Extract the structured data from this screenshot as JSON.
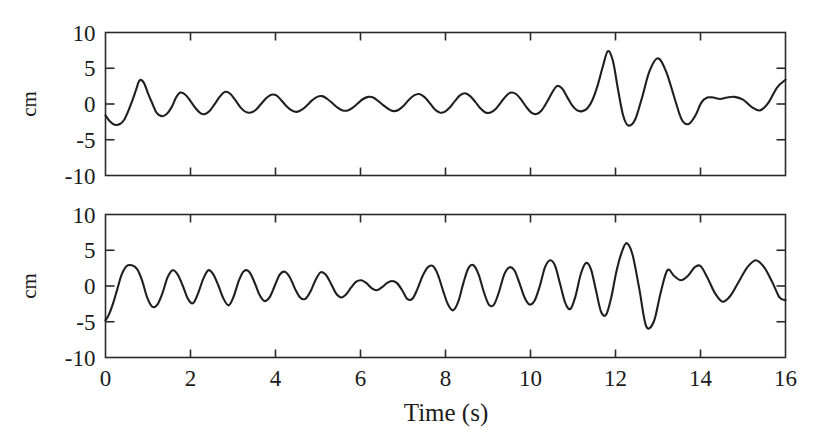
{
  "figure": {
    "type": "time-series-two-panel",
    "background_color": "#ffffff",
    "line_color": "#1f1f1f",
    "axis_color": "#2a2a2a",
    "xlabel": "Time (s)",
    "ylabel_top": "cm",
    "ylabel_bottom": "cm"
  },
  "chart_data": [
    {
      "type": "line",
      "title": "",
      "panel": "top",
      "xlabel": "",
      "ylabel": "cm",
      "xlim": [
        0,
        16
      ],
      "ylim": [
        -10,
        10
      ],
      "xticks": [
        0,
        2,
        4,
        6,
        8,
        10,
        12,
        14,
        16
      ],
      "xticklabels": [
        "",
        "",
        "",
        "",
        "",
        "",
        "",
        "",
        ""
      ],
      "yticks": [
        -10,
        -5,
        0,
        5,
        10
      ],
      "yticklabels": [
        "-10",
        "-5",
        "0",
        "5",
        "10"
      ],
      "grid": false,
      "legend": "none",
      "series": [
        {
          "name": "surface elevation (top record)",
          "x": [
            0.0,
            0.1,
            0.22,
            0.34,
            0.44,
            0.52,
            0.62,
            0.72,
            0.8,
            0.9,
            1.0,
            1.1,
            1.2,
            1.32,
            1.44,
            1.56,
            1.66,
            1.76,
            1.88,
            2.0,
            2.12,
            2.24,
            2.34,
            2.46,
            2.58,
            2.7,
            2.82,
            2.94,
            3.06,
            3.18,
            3.3,
            3.42,
            3.54,
            3.66,
            3.78,
            3.9,
            4.02,
            4.14,
            4.26,
            4.38,
            4.5,
            4.62,
            4.74,
            4.86,
            4.98,
            5.1,
            5.22,
            5.34,
            5.46,
            5.58,
            5.7,
            5.82,
            5.94,
            6.06,
            6.18,
            6.3,
            6.42,
            6.54,
            6.66,
            6.78,
            6.9,
            7.02,
            7.14,
            7.26,
            7.38,
            7.5,
            7.62,
            7.74,
            7.86,
            7.98,
            8.1,
            8.22,
            8.34,
            8.46,
            8.58,
            8.7,
            8.82,
            8.94,
            9.06,
            9.18,
            9.3,
            9.42,
            9.54,
            9.66,
            9.78,
            9.9,
            10.02,
            10.14,
            10.26,
            10.38,
            10.5,
            10.62,
            10.74,
            10.86,
            10.98,
            11.1,
            11.22,
            11.34,
            11.46,
            11.58,
            11.7,
            11.82,
            11.94,
            12.06,
            12.18,
            12.3,
            12.46,
            12.62,
            12.8,
            13.0,
            13.2,
            13.4,
            13.56,
            13.72,
            13.88,
            14.02,
            14.16,
            14.3,
            14.46,
            14.62,
            14.8,
            15.0,
            15.2,
            15.4,
            15.6,
            15.8,
            16.0
          ],
          "y": [
            -1.6,
            -2.4,
            -2.9,
            -2.8,
            -2.2,
            -1.2,
            0.3,
            2.0,
            3.3,
            3.0,
            1.5,
            0.1,
            -1.2,
            -1.7,
            -1.4,
            -0.4,
            0.9,
            1.6,
            1.3,
            0.4,
            -0.6,
            -1.3,
            -1.4,
            -0.9,
            0.1,
            1.1,
            1.7,
            1.4,
            0.5,
            -0.5,
            -1.1,
            -1.2,
            -0.8,
            0.0,
            0.8,
            1.3,
            1.2,
            0.5,
            -0.3,
            -0.9,
            -1.1,
            -0.8,
            -0.2,
            0.5,
            1.0,
            1.1,
            0.7,
            0.1,
            -0.5,
            -0.9,
            -0.9,
            -0.5,
            0.1,
            0.7,
            1.0,
            0.9,
            0.4,
            -0.2,
            -0.7,
            -1.0,
            -0.8,
            -0.2,
            0.6,
            1.2,
            1.4,
            1.0,
            0.2,
            -0.7,
            -1.2,
            -1.1,
            -0.5,
            0.4,
            1.2,
            1.5,
            1.1,
            0.3,
            -0.6,
            -1.2,
            -1.2,
            -0.7,
            0.2,
            1.1,
            1.6,
            1.4,
            0.6,
            -0.4,
            -1.2,
            -1.4,
            -0.9,
            0.2,
            1.5,
            2.5,
            2.2,
            1.0,
            -0.2,
            -0.9,
            -1.0,
            -0.6,
            0.6,
            2.6,
            5.2,
            7.4,
            6.0,
            2.0,
            -1.6,
            -3.0,
            -2.2,
            0.8,
            4.6,
            6.4,
            4.4,
            0.6,
            -2.2,
            -2.8,
            -1.6,
            0.2,
            0.9,
            0.9,
            0.7,
            0.9,
            1.0,
            0.6,
            -0.4,
            -0.9,
            0.2,
            2.3,
            3.4,
            2.2,
            0.0,
            -1.0,
            -0.2,
            1.2,
            2.0,
            1.6,
            0.4
          ]
        }
      ]
    },
    {
      "type": "line",
      "title": "",
      "panel": "bottom",
      "xlabel": "Time (s)",
      "ylabel": "cm",
      "xlim": [
        0,
        16
      ],
      "ylim": [
        -10,
        10
      ],
      "xticks": [
        0,
        2,
        4,
        6,
        8,
        10,
        12,
        14,
        16
      ],
      "xticklabels": [
        "0",
        "2",
        "4",
        "6",
        "8",
        "10",
        "12",
        "14",
        "16"
      ],
      "yticks": [
        -10,
        -5,
        0,
        5,
        10
      ],
      "yticklabels": [
        "-10",
        "-5",
        "0",
        "5",
        "10"
      ],
      "grid": false,
      "legend": "none",
      "series": [
        {
          "name": "surface elevation (bottom record)",
          "x": [
            0.0,
            0.08,
            0.18,
            0.28,
            0.38,
            0.5,
            0.62,
            0.74,
            0.86,
            0.98,
            1.1,
            1.22,
            1.34,
            1.46,
            1.58,
            1.7,
            1.82,
            1.94,
            2.06,
            2.18,
            2.3,
            2.42,
            2.54,
            2.66,
            2.78,
            2.9,
            3.02,
            3.14,
            3.26,
            3.38,
            3.5,
            3.62,
            3.74,
            3.86,
            3.98,
            4.1,
            4.22,
            4.34,
            4.46,
            4.58,
            4.7,
            4.82,
            4.94,
            5.06,
            5.18,
            5.3,
            5.42,
            5.54,
            5.66,
            5.78,
            5.9,
            6.02,
            6.14,
            6.26,
            6.38,
            6.5,
            6.62,
            6.74,
            6.86,
            6.98,
            7.1,
            7.22,
            7.34,
            7.46,
            7.58,
            7.7,
            7.82,
            7.94,
            8.06,
            8.18,
            8.3,
            8.42,
            8.54,
            8.66,
            8.78,
            8.9,
            9.02,
            9.14,
            9.26,
            9.38,
            9.5,
            9.62,
            9.74,
            9.86,
            9.98,
            10.1,
            10.22,
            10.34,
            10.46,
            10.58,
            10.7,
            10.82,
            10.94,
            11.06,
            11.18,
            11.3,
            11.42,
            11.54,
            11.66,
            11.78,
            11.9,
            12.02,
            12.14,
            12.26,
            12.4,
            12.56,
            12.72,
            12.9,
            13.06,
            13.22,
            13.38,
            13.54,
            13.7,
            13.86,
            14.0,
            14.16,
            14.34,
            14.52,
            14.7,
            14.9,
            15.1,
            15.3,
            15.5,
            15.7,
            15.86,
            16.0
          ],
          "y": [
            -4.8,
            -4.0,
            -2.4,
            -0.4,
            1.6,
            2.8,
            2.9,
            2.4,
            0.8,
            -1.6,
            -2.9,
            -2.6,
            -1.0,
            1.2,
            2.2,
            1.6,
            0.0,
            -1.8,
            -2.4,
            -1.0,
            1.0,
            2.2,
            1.6,
            0.0,
            -1.8,
            -2.7,
            -1.4,
            0.8,
            2.1,
            2.0,
            0.6,
            -1.2,
            -2.1,
            -1.6,
            0.0,
            1.6,
            2.0,
            1.2,
            -0.4,
            -1.6,
            -1.8,
            -0.8,
            0.8,
            1.9,
            1.6,
            0.4,
            -1.0,
            -1.6,
            -1.2,
            -0.2,
            0.6,
            0.8,
            0.4,
            -0.3,
            -0.6,
            -0.2,
            0.4,
            0.7,
            0.4,
            -0.6,
            -1.8,
            -1.8,
            -0.4,
            1.4,
            2.6,
            2.8,
            1.6,
            -0.6,
            -2.6,
            -3.4,
            -2.2,
            0.4,
            2.5,
            2.9,
            1.6,
            -0.8,
            -2.6,
            -2.6,
            -0.8,
            1.6,
            2.6,
            2.2,
            0.4,
            -1.6,
            -2.6,
            -2.0,
            0.0,
            2.6,
            3.6,
            2.8,
            0.2,
            -2.4,
            -3.2,
            -1.4,
            1.6,
            3.2,
            2.4,
            -0.6,
            -3.6,
            -4.0,
            -1.6,
            2.0,
            4.6,
            6.0,
            4.4,
            -0.4,
            -5.6,
            -5.0,
            -1.0,
            2.2,
            1.4,
            0.8,
            1.4,
            2.6,
            2.8,
            1.2,
            -1.0,
            -2.2,
            -1.4,
            0.6,
            2.6,
            3.6,
            2.6,
            0.4,
            -1.6,
            -2.0,
            -0.8,
            0.8,
            1.8,
            2.4,
            1.6,
            -0.6,
            -2.2
          ]
        }
      ]
    }
  ],
  "labels": {
    "xaxis_title": "Time (s)",
    "yaxis_title_top": "cm",
    "yaxis_title_bottom": "cm",
    "x_tick_labels": [
      "0",
      "2",
      "4",
      "6",
      "8",
      "10",
      "12",
      "14",
      "16"
    ],
    "y_tick_labels": [
      "10",
      "5",
      "0",
      "-5",
      "-10"
    ]
  }
}
